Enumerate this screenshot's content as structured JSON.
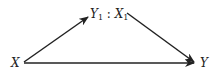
{
  "diagram": {
    "nodes": {
      "x": {
        "label": "X"
      },
      "y": {
        "label": "Y"
      },
      "mid": {
        "left_var": "Y",
        "left_sub": "1",
        "sep": " : ",
        "right_var": "X",
        "right_sub": "1"
      }
    },
    "edges": [
      {
        "from": "X",
        "to": "Y1 : X1"
      },
      {
        "from": "Y1 : X1",
        "to": "Y"
      },
      {
        "from": "X",
        "to": "Y"
      }
    ],
    "colors": {
      "stroke": "#222222",
      "background": "#ffffff"
    }
  }
}
